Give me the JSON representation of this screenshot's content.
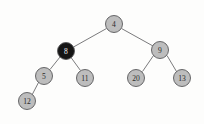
{
  "figure": {
    "kind": "binary-search-tree-diagram",
    "width": 204,
    "height": 124,
    "background_color": "#fdfdfc"
  },
  "style": {
    "node_gray": "#bdbdbd",
    "node_black": "#151515",
    "node_stroke": "#58585a",
    "edge_color": "#6b6b6d",
    "label_dark": "#2a2a2a",
    "label_light": "#f4f4f4"
  },
  "nodes": [
    {
      "id": "n4",
      "label": "4",
      "cx": 114,
      "cy": 24,
      "r": 8.5,
      "color": "gray",
      "text_color": "dark"
    },
    {
      "id": "n8",
      "label": "8",
      "cx": 66,
      "cy": 51,
      "r": 8.5,
      "color": "black",
      "text_color": "light"
    },
    {
      "id": "n9",
      "label": "9",
      "cx": 160,
      "cy": 50,
      "r": 8.5,
      "color": "gray",
      "text_color": "dark"
    },
    {
      "id": "n5",
      "label": "5",
      "cx": 44,
      "cy": 76,
      "r": 8.5,
      "color": "gray",
      "text_color": "dark"
    },
    {
      "id": "n11",
      "label": "11",
      "cx": 85,
      "cy": 78,
      "r": 8.5,
      "color": "gray",
      "text_color": "dark"
    },
    {
      "id": "n20",
      "label": "20",
      "cx": 136,
      "cy": 78,
      "r": 8.5,
      "color": "gray",
      "text_color": "dark"
    },
    {
      "id": "n13",
      "label": "13",
      "cx": 182,
      "cy": 78,
      "r": 8.5,
      "color": "gray",
      "text_color": "dark"
    },
    {
      "id": "n12",
      "label": "12",
      "cx": 27,
      "cy": 101,
      "r": 8.5,
      "color": "gray",
      "text_color": "dark"
    }
  ],
  "edges": [
    {
      "id": "e-4-8",
      "from": "n4",
      "to": "n8",
      "x1": 106.5,
      "y1": 28.5,
      "x2": 73.5,
      "y2": 47.0
    },
    {
      "id": "e-4-9",
      "from": "n4",
      "to": "n9",
      "x1": 121.5,
      "y1": 28.5,
      "x2": 153.0,
      "y2": 46.0
    },
    {
      "id": "e-8-5",
      "from": "n8",
      "to": "n5",
      "x1": 60.0,
      "y1": 57.0,
      "x2": 50.0,
      "y2": 69.5
    },
    {
      "id": "e-8-11",
      "from": "n8",
      "to": "n11",
      "x1": 71.0,
      "y1": 57.5,
      "x2": 80.5,
      "y2": 70.5
    },
    {
      "id": "e-5-12",
      "from": "n5",
      "to": "n12",
      "x1": 38.5,
      "y1": 82.5,
      "x2": 32.5,
      "y2": 94.0
    },
    {
      "id": "e-9-20",
      "from": "n9",
      "to": "n20",
      "x1": 153.5,
      "y1": 55.5,
      "x2": 142.5,
      "y2": 71.5
    },
    {
      "id": "e-9-13",
      "from": "n9",
      "to": "n13",
      "x1": 167.0,
      "y1": 55.5,
      "x2": 176.5,
      "y2": 71.5
    }
  ],
  "watermarks": {
    "mid_left": "        ",
    "mid_right": "         ",
    "bottom": "        "
  }
}
